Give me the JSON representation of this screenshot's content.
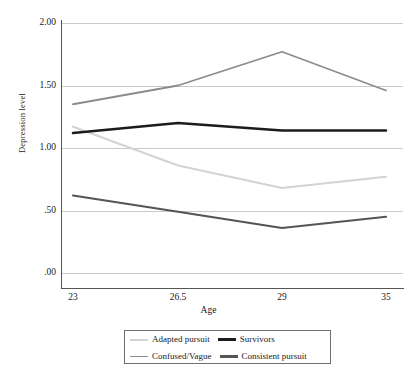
{
  "chart_data": {
    "type": "line",
    "title": "",
    "xlabel": "Age",
    "ylabel": "Depression level",
    "x": [
      23,
      26.5,
      29,
      35
    ],
    "categories": [
      "23",
      "26.5",
      "29",
      "35"
    ],
    "xtick_labels": [
      "23",
      "26.5",
      "29",
      "35"
    ],
    "ytick_labels": [
      "2.00",
      "1.50",
      "1.00",
      ".50",
      ".00"
    ],
    "ytick_values": [
      2.0,
      1.5,
      1.0,
      0.5,
      0.0
    ],
    "ylim": [
      0.0,
      2.0
    ],
    "xlim": [
      23,
      35
    ],
    "grid": "horizontal",
    "legend_position": "bottom",
    "series": [
      {
        "name": "Adapted pursuit",
        "values": [
          1.17,
          0.86,
          0.68,
          0.77
        ],
        "color": "#d3d3d0",
        "width": 2.0
      },
      {
        "name": "Survivors",
        "values": [
          1.12,
          1.2,
          1.14,
          1.14
        ],
        "color": "#1c1c1c",
        "width": 2.6
      },
      {
        "name": "Confused/Vague",
        "values": [
          1.35,
          1.5,
          1.77,
          1.46
        ],
        "color": "#8d8d88",
        "width": 1.8
      },
      {
        "name": "Consistent pursuit",
        "values": [
          0.62,
          0.49,
          0.36,
          0.45
        ],
        "color": "#555552",
        "width": 2.2
      }
    ]
  },
  "legend": {
    "rows": [
      [
        {
          "label": "Adapted pursuit",
          "series": 0
        },
        {
          "label": "Survivors",
          "series": 1
        }
      ],
      [
        {
          "label": "Confused/Vague",
          "series": 2
        },
        {
          "label": "Consistent pursuit",
          "series": 3
        }
      ]
    ]
  }
}
